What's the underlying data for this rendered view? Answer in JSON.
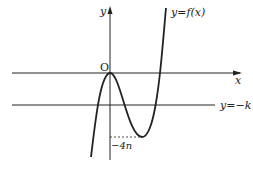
{
  "diagram": {
    "curve_label": "y=f(x)",
    "x_axis_label": "x",
    "y_axis_label": "y",
    "origin_label": "O",
    "horizontal_line_label": "y=−k",
    "min_value_label": "−4n",
    "colors": {
      "stroke": "#222222",
      "background": "#ffffff"
    }
  }
}
